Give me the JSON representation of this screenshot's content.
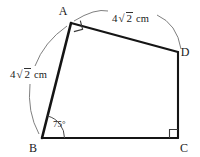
{
  "figure": {
    "type": "quadrilateral-geometry-diagram",
    "vertices": [
      {
        "id": "A",
        "label": "A",
        "x": 71,
        "y": 23
      },
      {
        "id": "B",
        "label": "B",
        "x": 42,
        "y": 138
      },
      {
        "id": "C",
        "label": "C",
        "x": 178,
        "y": 138
      },
      {
        "id": "D",
        "label": "D",
        "x": 178,
        "y": 52
      }
    ],
    "vertex_label_positions": [
      {
        "id": "A",
        "x": 63,
        "y": 15
      },
      {
        "id": "B",
        "x": 33,
        "y": 152
      },
      {
        "id": "C",
        "x": 184,
        "y": 152
      },
      {
        "id": "D",
        "x": 185,
        "y": 56
      }
    ],
    "edges": [
      {
        "id": "AB",
        "from": "A",
        "to": "B"
      },
      {
        "id": "BC",
        "from": "B",
        "to": "C"
      },
      {
        "id": "CD",
        "from": "C",
        "to": "D"
      },
      {
        "id": "DA",
        "from": "D",
        "to": "A"
      }
    ],
    "measurements": [
      {
        "id": "side-AD-length",
        "edge": "DA",
        "coefficient": "4",
        "radical": "2",
        "radical_symbol": "√",
        "unit": "cm",
        "full_text": "4√2 cm",
        "label_x": 118,
        "label_y": 20
      },
      {
        "id": "side-AB-length",
        "edge": "AB",
        "coefficient": "4",
        "radical": "2",
        "radical_symbol": "√",
        "unit": "cm",
        "full_text": "4√2 cm",
        "label_x": 12,
        "label_y": 76
      }
    ],
    "angles": [
      {
        "id": "angle-B",
        "vertex": "B",
        "label": "75°",
        "value": 75,
        "marker": "arc",
        "label_x": 53,
        "label_y": 127
      },
      {
        "id": "angle-A",
        "vertex": "A",
        "label": "",
        "value": 90,
        "marker": "right-angle-square"
      },
      {
        "id": "angle-C",
        "vertex": "C",
        "label": "",
        "value": 90,
        "marker": "right-angle-square"
      }
    ],
    "leader_arcs": [
      {
        "id": "leader-arc-top",
        "for": "side-AD-length"
      },
      {
        "id": "leader-arc-left",
        "for": "side-AB-length"
      }
    ],
    "colors": {
      "stroke": "#151515",
      "thin_stroke": "#5a5a5a",
      "text": "#1a1a1a",
      "background": "#ffffff"
    }
  }
}
